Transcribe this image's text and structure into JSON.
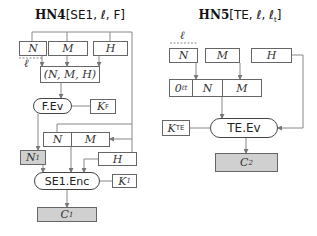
{
  "left": {
    "title_bold": "HN4",
    "title_rest": "[SE1, ℓ, F]",
    "n": "N",
    "m": "M",
    "h": "H",
    "ell": "ℓ",
    "tuple": "(N, M, H)",
    "fev": "F.Ev",
    "kf": "K",
    "kf_sub": "F",
    "n2": "N",
    "m2": "M",
    "n1": "N",
    "n1_sub": "1",
    "h2": "H",
    "enc": "SE1.Enc",
    "k1": "K",
    "k1_sub": "1",
    "c1": "C",
    "c1_sub": "1"
  },
  "right": {
    "title_bold": "HN5",
    "title_rest": "[TE, ℓ, ℓ",
    "title_sub": "t",
    "title_end": "]",
    "ell": "ℓ",
    "n": "N",
    "m": "M",
    "h": "H",
    "zero": "0",
    "zero_sup": "ℓt",
    "n2": "N",
    "m2": "M",
    "kte": "K",
    "kte_sub": "TE",
    "tev": "TE.Ev",
    "c2": "C",
    "c2_sub": "2"
  }
}
